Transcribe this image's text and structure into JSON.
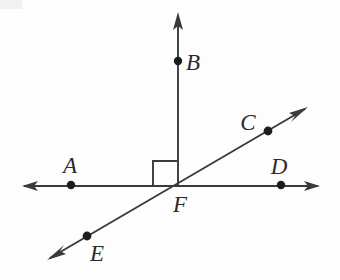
{
  "figure": {
    "background_color": "#fdfdfd",
    "stroke_color": "#3a3a3a",
    "label_color": "#2b2b2b",
    "dot_color": "#1d1d1d"
  },
  "labels": {
    "A": "A",
    "B": "B",
    "C": "C",
    "D": "D",
    "E": "E",
    "F": "F"
  },
  "geometry": {
    "points": [
      {
        "name": "A",
        "x": 71,
        "y": 185,
        "label": "A",
        "label_x": 70,
        "label_y": 173
      },
      {
        "name": "B",
        "x": 178,
        "y": 61,
        "label": "B",
        "label_x": 193,
        "label_y": 70
      },
      {
        "name": "C",
        "x": 268,
        "y": 131,
        "label": "C",
        "label_x": 248,
        "label_y": 130
      },
      {
        "name": "D",
        "x": 281,
        "y": 185,
        "label": "D",
        "label_x": 279,
        "label_y": 174
      },
      {
        "name": "E",
        "x": 87,
        "y": 236,
        "label": "E",
        "label_x": 97,
        "label_y": 261
      },
      {
        "name": "F",
        "x": 177,
        "y": 186,
        "label": "F",
        "label_x": 180,
        "label_y": 212
      }
    ],
    "lines": [
      {
        "name": "line-AD",
        "through": [
          "A",
          "F",
          "D"
        ],
        "x1": 22,
        "y1": 186,
        "x2": 320,
        "y2": 186,
        "arrow_start": true,
        "arrow_end": true
      },
      {
        "name": "line-EC",
        "through": [
          "E",
          "F",
          "C"
        ],
        "x1": 47,
        "y1": 260,
        "x2": 308,
        "y2": 107,
        "arrow_start": true,
        "arrow_end": true
      },
      {
        "name": "ray-FB",
        "through": [
          "F",
          "B"
        ],
        "x1": 177,
        "y1": 186,
        "x2": 178,
        "y2": 12,
        "arrow_start": false,
        "arrow_end": true
      }
    ],
    "right_angle": {
      "name": "right-angle-AFB",
      "vertex": "F",
      "size": 24,
      "x": 153,
      "y": 161,
      "w": 24,
      "h": 25
    }
  }
}
